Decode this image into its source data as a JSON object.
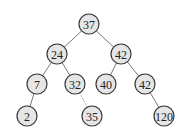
{
  "diagram": {
    "type": "binary-tree",
    "colors": {
      "node_fill": "#e6e6e6",
      "node_stroke": "#3a3a3a",
      "edge": "#6a6a6a",
      "text": "#222222"
    },
    "node_radius": 10,
    "nodes": [
      {
        "id": "n37",
        "label": "37",
        "x": 89,
        "y": 24
      },
      {
        "id": "n24",
        "label": "24",
        "x": 57,
        "y": 54
      },
      {
        "id": "n42a",
        "label": "42",
        "x": 121,
        "y": 54
      },
      {
        "id": "n7",
        "label": "7",
        "x": 37,
        "y": 84
      },
      {
        "id": "n32",
        "label": "32",
        "x": 75,
        "y": 84
      },
      {
        "id": "n40",
        "label": "40",
        "x": 106,
        "y": 84
      },
      {
        "id": "n42b",
        "label": "42",
        "x": 145,
        "y": 84
      },
      {
        "id": "n2",
        "label": "2",
        "x": 27,
        "y": 116
      },
      {
        "id": "n35",
        "label": "35",
        "x": 92,
        "y": 116
      },
      {
        "id": "n120",
        "label": "120",
        "x": 164,
        "y": 116
      }
    ],
    "edges": [
      {
        "from": "n37",
        "to": "n24"
      },
      {
        "from": "n37",
        "to": "n42a"
      },
      {
        "from": "n24",
        "to": "n7"
      },
      {
        "from": "n24",
        "to": "n32"
      },
      {
        "from": "n42a",
        "to": "n40"
      },
      {
        "from": "n42a",
        "to": "n42b"
      },
      {
        "from": "n7",
        "to": "n2"
      },
      {
        "from": "n32",
        "to": "n35",
        "style": "faint"
      },
      {
        "from": "n42b",
        "to": "n120"
      }
    ]
  }
}
